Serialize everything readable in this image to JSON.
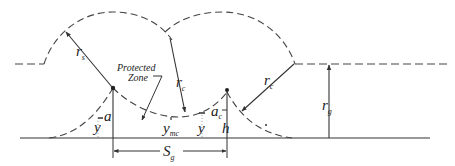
{
  "diagram": {
    "colors": {
      "line": "#333333",
      "background": "#ffffff"
    },
    "labels": {
      "r_s": {
        "main": "r",
        "sub": "s"
      },
      "protected_zone_line1": "Protected",
      "protected_zone_line2": "Zone",
      "r_c_left": {
        "main": "r",
        "sub": "c"
      },
      "r_c_right": {
        "main": "r",
        "sub": "c"
      },
      "r_g": {
        "main": "r",
        "sub": "g"
      },
      "a": "a",
      "y_left": "y",
      "y_mc": {
        "main": "y",
        "sub": "mc"
      },
      "y_right": "y",
      "a_c": {
        "main": "a",
        "sub": "c"
      },
      "h": "h",
      "S_g": {
        "main": "S",
        "sub": "g"
      }
    }
  }
}
